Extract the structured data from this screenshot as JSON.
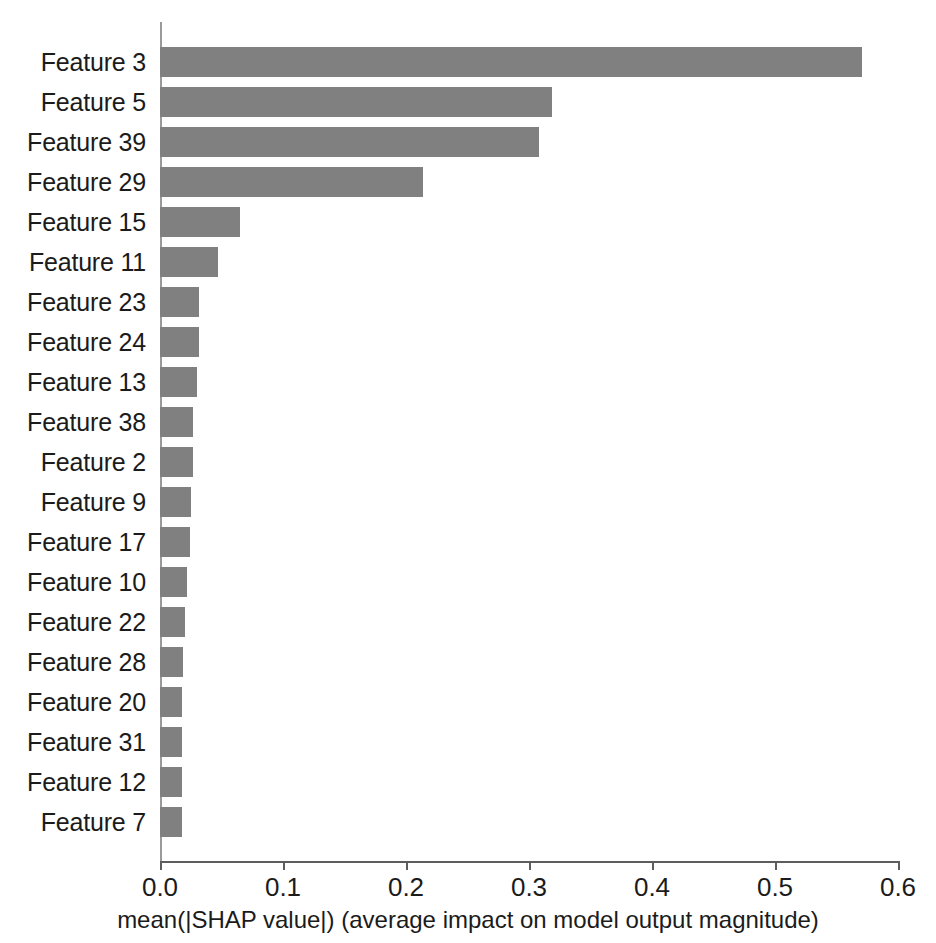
{
  "chart_data": {
    "type": "bar",
    "orientation": "horizontal",
    "title": "",
    "xlabel": "mean(|SHAP value|) (average impact on model output magnitude)",
    "ylabel": "",
    "xlim": [
      0.0,
      0.6
    ],
    "grid": false,
    "legend": null,
    "bar_color": "#808080",
    "axis_color": "#5d5d5d",
    "xticks": [
      "0.0",
      "0.1",
      "0.2",
      "0.3",
      "0.4",
      "0.5",
      "0.6"
    ],
    "xtick_values": [
      0.0,
      0.1,
      0.2,
      0.3,
      0.4,
      0.5,
      0.6
    ],
    "categories": [
      "Feature 3",
      "Feature 5",
      "Feature 39",
      "Feature 29",
      "Feature 15",
      "Feature 11",
      "Feature 23",
      "Feature 24",
      "Feature 13",
      "Feature 38",
      "Feature 2",
      "Feature 9",
      "Feature 17",
      "Feature 10",
      "Feature 22",
      "Feature 28",
      "Feature 20",
      "Feature 31",
      "Feature 12",
      "Feature 7"
    ],
    "values": [
      0.571,
      0.319,
      0.308,
      0.214,
      0.065,
      0.047,
      0.032,
      0.032,
      0.03,
      0.027,
      0.027,
      0.025,
      0.024,
      0.022,
      0.02,
      0.019,
      0.018,
      0.018,
      0.018,
      0.018
    ]
  }
}
